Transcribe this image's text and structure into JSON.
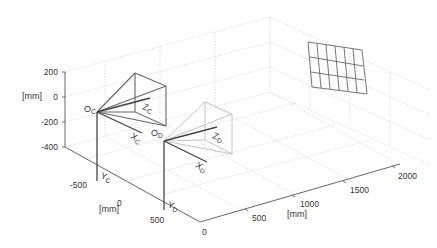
{
  "figure": {
    "type": "3d-camera-projector-calibration-diagram",
    "z_axis": {
      "unit_label": "[mm]",
      "ticks": [
        "200",
        "0",
        "-200",
        "-400"
      ]
    },
    "y_axis": {
      "unit_label": "[mm]",
      "ticks": [
        "-500",
        "0",
        "500"
      ]
    },
    "x_axis": {
      "unit_label": "[mm]",
      "ticks": [
        "0",
        "500",
        "1000",
        "1500",
        "2000"
      ]
    },
    "camera": {
      "origin": {
        "main": "O",
        "sub": "C"
      },
      "x": {
        "main": "X",
        "sub": "C"
      },
      "y": {
        "main": "Y",
        "sub": "C"
      },
      "z": {
        "main": "Z",
        "sub": "C"
      },
      "color": "#555555"
    },
    "projector": {
      "origin": {
        "main": "O",
        "sub": "D"
      },
      "x": {
        "main": "X",
        "sub": "D"
      },
      "y": {
        "main": "Y",
        "sub": "D"
      },
      "z": {
        "main": "Z",
        "sub": "D"
      },
      "color": "#bbbbbb"
    },
    "board": {
      "rows": 3,
      "cols": 6,
      "color": "#666666"
    },
    "colors": {
      "axis": "#444444",
      "grid": "#d6d6d6",
      "background": "#ffffff"
    }
  }
}
